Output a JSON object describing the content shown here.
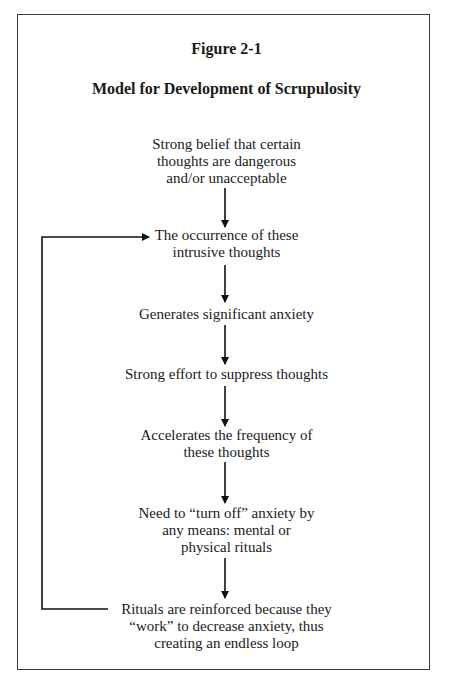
{
  "figure": {
    "label": "Figure 2-1",
    "title": "Model for Development of Scrupulosity"
  },
  "nodes": [
    {
      "id": "n1",
      "lines": [
        "Strong belief that certain",
        "thoughts are dangerous",
        "and/or unacceptable"
      ]
    },
    {
      "id": "n2",
      "lines": [
        "The occurrence of these",
        "intrusive thoughts"
      ]
    },
    {
      "id": "n3",
      "lines": [
        "Generates significant anxiety"
      ]
    },
    {
      "id": "n4",
      "lines": [
        "Strong effort to suppress thoughts"
      ]
    },
    {
      "id": "n5",
      "lines": [
        "Accelerates the frequency of",
        "these thoughts"
      ]
    },
    {
      "id": "n6",
      "lines": [
        "Need to “turn off” anxiety by",
        "any means: mental or",
        "physical rituals"
      ]
    },
    {
      "id": "n7",
      "lines": [
        "Rituals are reinforced because they",
        "“work” to decrease anxiety, thus",
        "creating an endless loop"
      ]
    }
  ],
  "edges": [
    {
      "from": "n1",
      "to": "n2"
    },
    {
      "from": "n2",
      "to": "n3"
    },
    {
      "from": "n3",
      "to": "n4"
    },
    {
      "from": "n4",
      "to": "n5"
    },
    {
      "from": "n5",
      "to": "n6"
    },
    {
      "from": "n6",
      "to": "n7"
    },
    {
      "from": "n7",
      "to": "n2",
      "type": "loop-back"
    }
  ]
}
